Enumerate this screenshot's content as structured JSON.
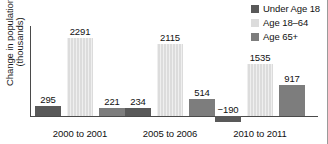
{
  "chart_data": {
    "type": "bar",
    "title": "",
    "subtitle": "",
    "xlabel": "",
    "ylabel_line1": "Change in population",
    "ylabel_line2": "(thousands)",
    "categories": [
      "2000 to 2001",
      "2005 to 2006",
      "2010 to 2011"
    ],
    "series": [
      {
        "name": "Under Age 18",
        "color": "#595959",
        "values": [
          295,
          234,
          -190
        ],
        "labels": [
          "295",
          "234",
          "−190"
        ]
      },
      {
        "name": "Age 18–64",
        "color": "#dcdcdc",
        "values": [
          2291,
          2115,
          1535
        ],
        "labels": [
          "2291",
          "2115",
          "1535"
        ]
      },
      {
        "name": "Age 65+",
        "color": "#7d7d7d",
        "values": [
          221,
          514,
          917
        ],
        "labels": [
          "221",
          "514",
          "917"
        ]
      }
    ],
    "ylim": [
      -400,
      2600
    ],
    "grid": false,
    "legend_position": "top-right",
    "zero_line": true
  },
  "legend": {
    "items": [
      {
        "label": "Under Age 18"
      },
      {
        "label": "Age 18–64"
      },
      {
        "label": "Age 65+"
      }
    ]
  }
}
